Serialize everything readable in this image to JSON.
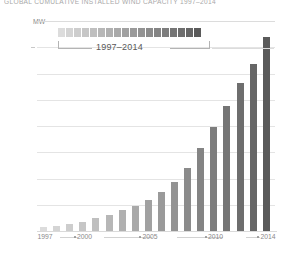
{
  "chart_data": {
    "type": "bar",
    "title": "GLOBAL CUMULATIVE INSTALLED WIND CAPACITY 1997–2014",
    "xlabel": "",
    "ylabel": "MW",
    "unit": "MW",
    "ylim": [
      0,
      400000
    ],
    "grid": true,
    "legend_position": "top-inside",
    "ytick_labels": [
      "400,000",
      "350,000",
      "300,000",
      "250,000",
      "200,000",
      "150,000",
      "100,000",
      "50,000",
      "0"
    ],
    "ytick_values": [
      400000,
      350000,
      300000,
      250000,
      200000,
      150000,
      100000,
      50000,
      0
    ],
    "xtick_labels": [
      "1997",
      "2000",
      "2005",
      "2010",
      "2014"
    ],
    "categories": [
      "1997",
      "1998",
      "1999",
      "2000",
      "2001",
      "2002",
      "2003",
      "2004",
      "2005",
      "2006",
      "2007",
      "2008",
      "2009",
      "2010",
      "2011",
      "2012",
      "2013",
      "2014"
    ],
    "values": [
      7600,
      10200,
      13600,
      17400,
      23900,
      31100,
      39431,
      47620,
      59091,
      74052,
      93820,
      120624,
      158864,
      197637,
      238035,
      282850,
      318644,
      369553
    ],
    "bar_colors": [
      "#dcdcdc",
      "#d4d4d4",
      "#cdcdcd",
      "#c6c6c6",
      "#bfbfbf",
      "#b7b7b7",
      "#b0b0b0",
      "#a9a9a9",
      "#a1a1a1",
      "#9a9a9a",
      "#939393",
      "#8b8b8b",
      "#848484",
      "#7d7d7d",
      "#757575",
      "#6e6e6e",
      "#666666",
      "#5a5a5a"
    ],
    "annotations": [
      {
        "name": "legend-range-label",
        "text": "1997–2014"
      }
    ]
  },
  "legend": {
    "range_label": "1997–2014",
    "swatch_count": 18
  },
  "axis": {
    "unit_label": "MW"
  }
}
